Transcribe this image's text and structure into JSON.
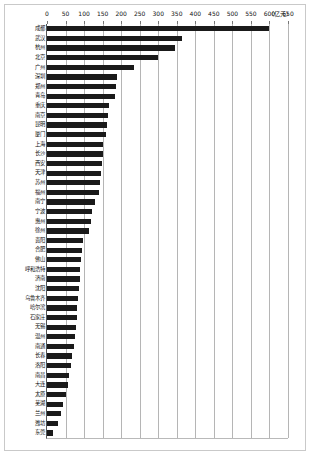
{
  "chart_data": {
    "type": "bar",
    "orientation": "horizontal",
    "title": "",
    "xlabel": "",
    "ylabel": "",
    "unit_label": "（亿元）",
    "xlim": [
      0,
      650
    ],
    "xticks": [
      0,
      50,
      100,
      150,
      200,
      250,
      300,
      350,
      400,
      450,
      500,
      550,
      600,
      650
    ],
    "grid": true,
    "legend": "none",
    "bar_color": "#1a1a1a",
    "categories": [
      "成都",
      "武汉",
      "杭州",
      "北京",
      "广州",
      "深圳",
      "郑州",
      "青岛",
      "重庆",
      "南京",
      "昆明",
      "厦门",
      "上海",
      "长沙",
      "西安",
      "天津",
      "苏州",
      "福州",
      "南宁",
      "宁波",
      "惠州",
      "徐州",
      "贵阳",
      "合肥",
      "佛山",
      "呼和浩特",
      "济南",
      "沈阳",
      "乌鲁木齐",
      "哈尔滨",
      "石家庄",
      "无锡",
      "温州",
      "南通",
      "长春",
      "洛阳",
      "南昌",
      "大连",
      "太原",
      "芜湖",
      "兰州",
      "潍坊",
      "东莞"
    ],
    "values": [
      600,
      365,
      345,
      300,
      235,
      188,
      185,
      183,
      168,
      165,
      163,
      160,
      152,
      150,
      148,
      146,
      142,
      140,
      130,
      122,
      118,
      112,
      96,
      94,
      92,
      90,
      88,
      86,
      84,
      82,
      80,
      78,
      76,
      72,
      68,
      64,
      60,
      56,
      50,
      44,
      38,
      30,
      15
    ]
  }
}
